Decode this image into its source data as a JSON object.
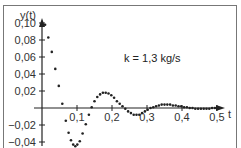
{
  "chart_data": {
    "type": "scatter",
    "title": "",
    "annotation": "k = 1,3 kg/s",
    "xlabel": "t",
    "ylabel": "y(t)",
    "xlim": [
      0,
      0.55
    ],
    "ylim": [
      -0.05,
      0.11
    ],
    "grid": false,
    "legend": null,
    "x_ticks": [
      {
        "value": 0.1,
        "label": "0,1"
      },
      {
        "value": 0.2,
        "label": "0,2"
      },
      {
        "value": 0.3,
        "label": "0,3"
      },
      {
        "value": 0.4,
        "label": "0,4"
      },
      {
        "value": 0.5,
        "label": "0,5"
      }
    ],
    "y_ticks": [
      {
        "value": 0.1,
        "label": "0,10"
      },
      {
        "value": 0.08,
        "label": "0,08"
      },
      {
        "value": 0.06,
        "label": "0,06"
      },
      {
        "value": 0.04,
        "label": "0,04"
      },
      {
        "value": 0.02,
        "label": "0,02"
      },
      {
        "value": -0.02,
        "label": "−0,02"
      },
      {
        "value": -0.04,
        "label": "−0,04"
      }
    ],
    "series": [
      {
        "name": "y(t)",
        "points": [
          [
            0.0,
            0.1
          ],
          [
            0.009,
            0.098
          ],
          [
            0.018,
            0.083
          ],
          [
            0.028,
            0.066
          ],
          [
            0.038,
            0.046
          ],
          [
            0.048,
            0.026
          ],
          [
            0.058,
            0.005
          ],
          [
            0.068,
            -0.015
          ],
          [
            0.076,
            -0.029
          ],
          [
            0.083,
            -0.038
          ],
          [
            0.089,
            -0.043
          ],
          [
            0.095,
            -0.045
          ],
          [
            0.101,
            -0.043
          ],
          [
            0.108,
            -0.039
          ],
          [
            0.116,
            -0.03
          ],
          [
            0.125,
            -0.019
          ],
          [
            0.134,
            -0.008
          ],
          [
            0.142,
            0.001
          ],
          [
            0.15,
            0.008
          ],
          [
            0.158,
            0.013
          ],
          [
            0.166,
            0.016
          ],
          [
            0.174,
            0.018
          ],
          [
            0.182,
            0.018
          ],
          [
            0.19,
            0.017
          ],
          [
            0.198,
            0.015
          ],
          [
            0.206,
            0.012
          ],
          [
            0.214,
            0.008
          ],
          [
            0.222,
            0.005
          ],
          [
            0.23,
            0.002
          ],
          [
            0.238,
            -0.001
          ],
          [
            0.246,
            -0.004
          ],
          [
            0.254,
            -0.006
          ],
          [
            0.262,
            -0.008
          ],
          [
            0.27,
            -0.008
          ],
          [
            0.278,
            -0.008
          ],
          [
            0.286,
            -0.006
          ],
          [
            0.294,
            -0.004
          ],
          [
            0.302,
            -0.002
          ],
          [
            0.31,
            0.0
          ],
          [
            0.318,
            0.001
          ],
          [
            0.326,
            0.002
          ],
          [
            0.334,
            0.003
          ],
          [
            0.342,
            0.004
          ],
          [
            0.35,
            0.004
          ],
          [
            0.358,
            0.004
          ],
          [
            0.366,
            0.004
          ],
          [
            0.374,
            0.003
          ],
          [
            0.382,
            0.003
          ],
          [
            0.39,
            0.002
          ],
          [
            0.398,
            0.002
          ],
          [
            0.406,
            0.001
          ],
          [
            0.414,
            0.001
          ],
          [
            0.422,
            0.0
          ],
          [
            0.43,
            0.0
          ],
          [
            0.438,
            -0.001
          ],
          [
            0.446,
            -0.001
          ],
          [
            0.454,
            -0.001
          ],
          [
            0.462,
            -0.001
          ],
          [
            0.47,
            -0.001
          ],
          [
            0.478,
            -0.001
          ],
          [
            0.486,
            0.0
          ],
          [
            0.494,
            0.0
          ],
          [
            0.502,
            0.0
          ]
        ]
      }
    ]
  },
  "colors": {
    "axis": "#222222",
    "points": "#222222",
    "frame": "#777777"
  }
}
